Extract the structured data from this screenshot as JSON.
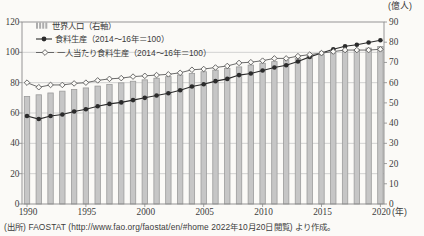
{
  "figure": {
    "source": "(出所) FAOSTAT (http://www.fao.org/faostat/en/#home  2022年10月20日閲覧) より作成。"
  },
  "chart_data": {
    "type": "bar",
    "subtype": "combo-bar-line",
    "x": [
      1990,
      1991,
      1992,
      1993,
      1994,
      1995,
      1996,
      1997,
      1998,
      1999,
      2000,
      2001,
      2002,
      2003,
      2004,
      2005,
      2006,
      2007,
      2008,
      2009,
      2010,
      2011,
      2012,
      2013,
      2014,
      2015,
      2016,
      2017,
      2018,
      2019,
      2020
    ],
    "x_tick_labels": [
      "1990",
      "1995",
      "2000",
      "2005",
      "2010",
      "2015",
      "2020"
    ],
    "x_axis_unit": "(年)",
    "left_axis": {
      "min": 0,
      "max": 120,
      "step": 20,
      "tick_labels": [
        "0",
        "20",
        "40",
        "60",
        "80",
        "100",
        "120"
      ]
    },
    "right_axis": {
      "min": 0,
      "max": 90,
      "step": 10,
      "tick_labels": [
        "0",
        "10",
        "20",
        "30",
        "40",
        "50",
        "60",
        "70",
        "80",
        "90"
      ],
      "unit": "(億人)"
    },
    "grid": true,
    "legend_position": "top-left",
    "series": [
      {
        "name": "世界人口（右軸）",
        "type": "bar",
        "axis": "right",
        "color": "#c6c6c6",
        "edge_color": "#9b9b9b",
        "values": [
          53.2,
          54.0,
          54.9,
          55.8,
          56.6,
          57.4,
          58.3,
          59.1,
          59.9,
          60.7,
          61.4,
          62.2,
          63.0,
          63.8,
          64.6,
          65.4,
          66.2,
          67.0,
          67.8,
          68.7,
          69.6,
          70.4,
          71.3,
          72.1,
          73.0,
          73.8,
          74.6,
          75.5,
          76.3,
          77.1,
          77.9
        ]
      },
      {
        "name": "食料生産（2014～16年＝100）",
        "type": "line",
        "marker": "filled-circle",
        "axis": "left",
        "color": "#2b2b2b",
        "values": [
          58,
          56,
          58,
          59,
          61,
          62.5,
          64.5,
          66,
          67,
          68.5,
          70,
          71.5,
          73,
          75,
          77.5,
          79,
          81,
          82.5,
          85,
          86,
          88,
          90,
          91.5,
          94,
          97,
          99.5,
          102,
          104,
          105,
          106.5,
          108
        ]
      },
      {
        "name": "一人当たり食料生産（2014～16年＝100）",
        "type": "line",
        "marker": "open-diamond",
        "axis": "left",
        "color": "#5a5a5a",
        "values": [
          80,
          77,
          78.5,
          78.5,
          79.5,
          80,
          81.5,
          82.5,
          83,
          84,
          84.5,
          85,
          85.5,
          86.5,
          88.5,
          89,
          90,
          91,
          93,
          93.5,
          94.5,
          96,
          96,
          97.5,
          98.5,
          99.5,
          100.5,
          101.5,
          101.5,
          101.5,
          102
        ]
      }
    ]
  }
}
